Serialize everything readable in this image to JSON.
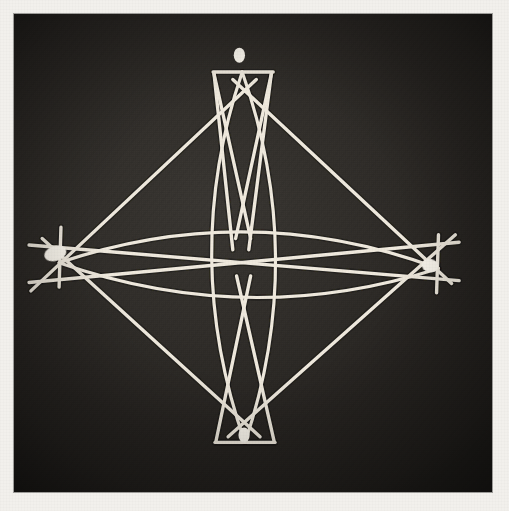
{
  "artwork": {
    "title": "String Construction Photograph",
    "medium": "white threads and beads on dark board",
    "background_color": "#302d29",
    "mount_color": "#f2f0ec",
    "thread_color": "#efe9dd",
    "bead_color": "#fbf7ee",
    "plate": {
      "x": 14,
      "y": 14,
      "width": 478,
      "height": 478
    }
  },
  "geometry": {
    "vertices": [
      {
        "name": "top",
        "label": "top-vertex",
        "x": 243,
        "y": 58,
        "bead": true,
        "bar": "horizontal",
        "bar_length": 64
      },
      {
        "name": "left",
        "label": "left-vertex",
        "x": 48,
        "y": 260,
        "bead": true,
        "bar": "vertical",
        "bar_length": 64
      },
      {
        "name": "right",
        "label": "right-vertex",
        "x": 452,
        "y": 266,
        "bead": true,
        "bar": "vertical",
        "bar_length": 62
      },
      {
        "name": "bottom",
        "label": "bottom-vertex",
        "x": 247,
        "y": 462,
        "bead": true,
        "bar": "horizontal",
        "bar_length": 64
      }
    ],
    "center": {
      "x": 244,
      "y": 258
    },
    "beads": [
      {
        "at": "top",
        "x": 240,
        "y": 44,
        "rx": 6,
        "ry": 8,
        "rotate": 0
      },
      {
        "at": "left",
        "x": 44,
        "y": 256,
        "rx": 12,
        "ry": 8,
        "rotate": -18
      },
      {
        "at": "right",
        "x": 443,
        "y": 269,
        "rx": 9,
        "ry": 7,
        "rotate": 12
      },
      {
        "at": "bottom",
        "x": 245,
        "y": 450,
        "rx": 6,
        "ry": 8,
        "rotate": 0
      }
    ],
    "straight_lines": [
      {
        "id": "diag-tl",
        "from": [
          258,
          70
        ],
        "to": [
          18,
          296
        ]
      },
      {
        "id": "diag-tr",
        "from": [
          233,
          70
        ],
        "to": [
          466,
          288
        ]
      },
      {
        "id": "diag-bl",
        "from": [
          262,
          452
        ],
        "to": [
          30,
          240
        ]
      },
      {
        "id": "diag-br",
        "from": [
          228,
          452
        ],
        "to": [
          470,
          236
        ]
      },
      {
        "id": "long-h-upper",
        "from": [
          16,
          247
        ],
        "to": [
          474,
          285
        ]
      },
      {
        "id": "long-h-lower",
        "from": [
          16,
          287
        ],
        "to": [
          474,
          244
        ]
      },
      {
        "id": "top-bar",
        "from": [
          212,
          62
        ],
        "to": [
          276,
          62
        ]
      },
      {
        "id": "bottom-bar",
        "from": [
          214,
          458
        ],
        "to": [
          278,
          458
        ]
      },
      {
        "id": "left-bar",
        "from": [
          50,
          228
        ],
        "to": [
          48,
          292
        ]
      },
      {
        "id": "right-bar",
        "from": [
          452,
          236
        ],
        "to": [
          450,
          298
        ]
      },
      {
        "id": "inner-x-left",
        "from": [
          213,
          64
        ],
        "to": [
          252,
          240
        ]
      },
      {
        "id": "inner-x-right",
        "from": [
          274,
          64
        ],
        "to": [
          236,
          240
        ]
      },
      {
        "id": "inner-xb-left",
        "from": [
          215,
          457
        ],
        "to": [
          252,
          280
        ]
      },
      {
        "id": "inner-xb-right",
        "from": [
          277,
          457
        ],
        "to": [
          237,
          280
        ]
      },
      {
        "id": "strut-left",
        "from": [
          213,
          64
        ],
        "to": [
          233,
          252
        ]
      },
      {
        "id": "strut-right",
        "from": [
          274,
          64
        ],
        "to": [
          250,
          252
        ]
      }
    ],
    "curved_lines": [
      {
        "id": "lens-top",
        "type": "horizontal-arc",
        "from": [
          48,
          266
        ],
        "to": [
          452,
          272
        ],
        "bulge": -36
      },
      {
        "id": "lens-bottom",
        "type": "horizontal-arc",
        "from": [
          48,
          266
        ],
        "to": [
          452,
          272
        ],
        "bulge": 34
      },
      {
        "id": "lens-vert-left",
        "type": "vertical-arc",
        "from": [
          243,
          62
        ],
        "to": [
          246,
          458
        ],
        "bulge": -34
      },
      {
        "id": "lens-vert-right",
        "type": "vertical-arc",
        "from": [
          243,
          62
        ],
        "to": [
          246,
          458
        ],
        "bulge": 34
      }
    ]
  }
}
